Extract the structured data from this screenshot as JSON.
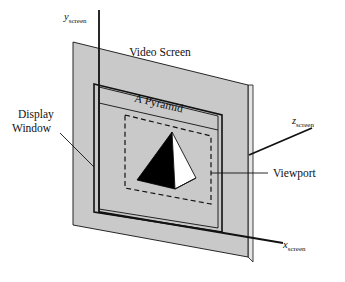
{
  "figure": {
    "background_color": "#ffffff",
    "screen_fill_color": "#c9c9c9",
    "screen_edge_color": "#e2e2e2",
    "line_color": "#111111",
    "pyramid_dark_face_color": "#000000",
    "pyramid_light_face_color": "#ffffff"
  },
  "labels": {
    "video_screen": "Video Screen",
    "a_pyramid": "A Pyramid",
    "display_window_line1": "Display",
    "display_window_line2": "Window",
    "viewport": "Viewport"
  },
  "axes": {
    "y": {
      "var": "y",
      "sub": "screen"
    },
    "x": {
      "var": "x",
      "sub": "screen"
    },
    "z": {
      "var": "z",
      "sub": "screen"
    }
  }
}
